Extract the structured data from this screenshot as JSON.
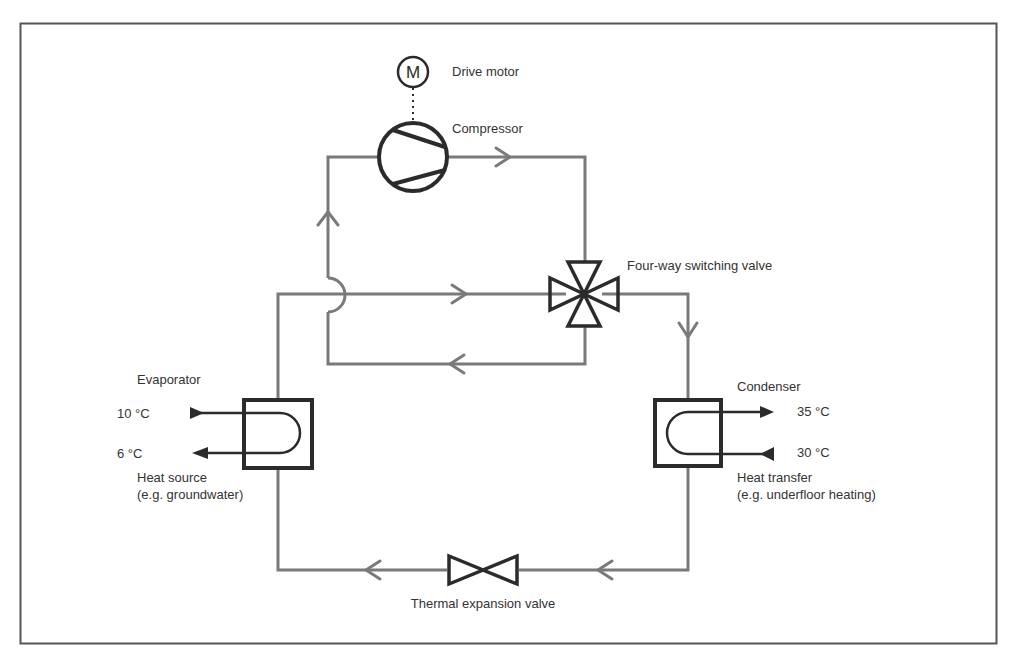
{
  "diagram": {
    "colors": {
      "pipe": "#7a7a7a",
      "symbol": "#2b2b2b",
      "text": "#333333",
      "frame": "#555555"
    },
    "components": {
      "drive_motor": {
        "label": "Drive motor",
        "symbol": "M"
      },
      "compressor": {
        "label": "Compressor"
      },
      "four_way_valve": {
        "label": "Four-way switching valve"
      },
      "evaporator": {
        "label": "Evaporator",
        "temp_in": "10 °C",
        "temp_out": "6 °C",
        "source_label": "Heat source",
        "source_example": "(e.g. groundwater)"
      },
      "condenser": {
        "label": "Condenser",
        "temp_out": "35 °C",
        "temp_in": "30 °C",
        "transfer_label": "Heat transfer",
        "transfer_example": "(e.g. underfloor heating)"
      },
      "expansion_valve": {
        "label": "Thermal expansion valve"
      }
    }
  }
}
